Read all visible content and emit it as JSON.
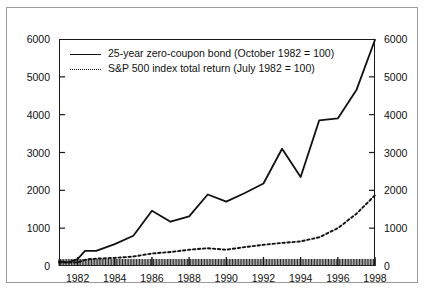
{
  "chart_data": {
    "type": "line",
    "title": "",
    "xlabel": "",
    "ylabel": "",
    "xlim": [
      1981.0,
      1998.0
    ],
    "ylim": [
      0,
      6000
    ],
    "yticks": [
      0,
      1000,
      2000,
      3000,
      4000,
      5000,
      6000
    ],
    "xticks": [
      1982,
      1984,
      1986,
      1988,
      1990,
      1992,
      1994,
      1996,
      1998
    ],
    "grid": false,
    "dual_y_axis": true,
    "left_axis_labels": [
      "6000",
      "5000",
      "4000",
      "3000",
      "2000",
      "1000",
      "0"
    ],
    "right_axis_labels": [
      "6000",
      "5000",
      "4000",
      "3000",
      "2000",
      "1000",
      "0"
    ],
    "xtick_labels": [
      "1982",
      "1984",
      "1986",
      "1988",
      "1990",
      "1992",
      "1994",
      "1996",
      "1998"
    ],
    "legend_position": "upper-left",
    "series": [
      {
        "name": "25-year zero-coupon bond (October 1982 = 100)",
        "style": "solid",
        "color": "#111111",
        "x": [
          1981.0,
          1981.5,
          1982.0,
          1982.4,
          1983.0,
          1984.0,
          1985.0,
          1986.0,
          1987.0,
          1988.0,
          1989.0,
          1990.0,
          1991.0,
          1992.0,
          1993.0,
          1994.0,
          1995.0,
          1996.0,
          1997.0,
          1998.0
        ],
        "values": [
          120,
          95,
          180,
          400,
          400,
          580,
          800,
          1460,
          1170,
          1310,
          1890,
          1700,
          1930,
          2180,
          3100,
          2350,
          3850,
          3900,
          4650,
          5980
        ]
      },
      {
        "name": "S&P 500 index total return (July 1982 = 100)",
        "style": "dotted",
        "color": "#111111",
        "x": [
          1981.0,
          1982.0,
          1982.5,
          1983.0,
          1984.0,
          1985.0,
          1986.0,
          1987.0,
          1988.0,
          1989.0,
          1990.0,
          1991.0,
          1992.0,
          1993.0,
          1994.0,
          1995.0,
          1996.0,
          1997.0,
          1998.0
        ],
        "values": [
          90,
          95,
          175,
          195,
          215,
          250,
          330,
          370,
          430,
          470,
          430,
          500,
          560,
          610,
          650,
          760,
          1000,
          1380,
          1870
        ]
      }
    ]
  },
  "legend": {
    "entries": [
      {
        "label": "25-year zero-coupon bond (October 1982 = 100)",
        "style": "solid"
      },
      {
        "label": "S&P 500 index total return (July 1982 = 100)",
        "style": "dotted"
      }
    ]
  }
}
